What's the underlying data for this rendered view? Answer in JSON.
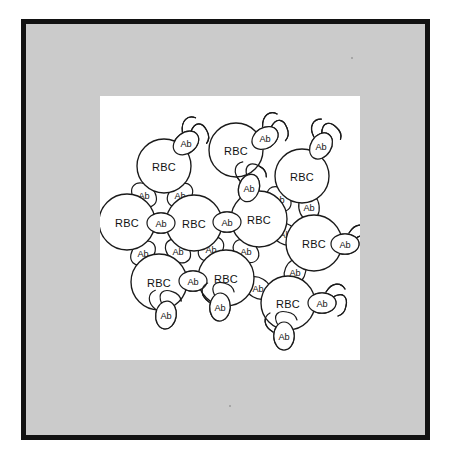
{
  "figure": {
    "canvas_background": "#ffffff",
    "mat_color": "#cbcbcb",
    "frame_color": "#121212",
    "ink_color": "#1a1a1a"
  },
  "legend": {
    "cell_label": "RBC",
    "antibody_label": "Ab"
  },
  "chart_data": {
    "type": "diagram",
    "cell_label": "RBC",
    "antibody_label": "Ab",
    "cell_count": 10,
    "antibody_count": 24,
    "cells": [
      {
        "id": "rbc-1",
        "label": "RBC",
        "cx": 64,
        "cy": 70,
        "r": 27
      },
      {
        "id": "rbc-2",
        "label": "RBC",
        "cx": 136,
        "cy": 54,
        "r": 27
      },
      {
        "id": "rbc-3",
        "label": "RBC",
        "cx": 202,
        "cy": 80,
        "r": 27
      },
      {
        "id": "rbc-4",
        "label": "RBC",
        "cx": 27,
        "cy": 126,
        "r": 28
      },
      {
        "id": "rbc-5",
        "label": "RBC",
        "cx": 94,
        "cy": 127,
        "r": 28
      },
      {
        "id": "rbc-6",
        "label": "RBC",
        "cx": 159,
        "cy": 123,
        "r": 28
      },
      {
        "id": "rbc-7",
        "label": "RBC",
        "cx": 214,
        "cy": 147,
        "r": 28
      },
      {
        "id": "rbc-8",
        "label": "RBC",
        "cx": 59,
        "cy": 186,
        "r": 28
      },
      {
        "id": "rbc-9",
        "label": "RBC",
        "cx": 126,
        "cy": 182,
        "r": 28
      },
      {
        "id": "rbc-10",
        "label": "RBC",
        "cx": 188,
        "cy": 207,
        "r": 27
      }
    ],
    "antibodies": [
      {
        "id": "ab-1",
        "label": "Ab",
        "cx": 86,
        "cy": 47,
        "rot": -38,
        "arms": "both"
      },
      {
        "id": "ab-2",
        "label": "Ab",
        "cx": 165,
        "cy": 42,
        "rot": -32,
        "arms": "both"
      },
      {
        "id": "ab-3",
        "label": "Ab",
        "cx": 221,
        "cy": 50,
        "rot": -58,
        "arms": "both"
      },
      {
        "id": "ab-4",
        "label": "Ab",
        "cx": 44,
        "cy": 99,
        "rot": 42,
        "arms": "none"
      },
      {
        "id": "ab-5",
        "label": "Ab",
        "cx": 80,
        "cy": 99,
        "rot": -38,
        "arms": "none"
      },
      {
        "id": "ab-6",
        "label": "Ab",
        "cx": 149,
        "cy": 92,
        "rot": -72,
        "arms": "both"
      },
      {
        "id": "ab-7",
        "label": "Ab",
        "cx": 179,
        "cy": 103,
        "rot": 48,
        "arms": "none"
      },
      {
        "id": "ab-8",
        "label": "Ab",
        "cx": 209,
        "cy": 111,
        "rot": 82,
        "arms": "none"
      },
      {
        "id": "ab-9",
        "label": "Ab",
        "cx": 61,
        "cy": 127,
        "rot": 0,
        "arms": "none"
      },
      {
        "id": "ab-10",
        "label": "Ab",
        "cx": 127,
        "cy": 126,
        "rot": 0,
        "arms": "none"
      },
      {
        "id": "ab-11",
        "label": "Ab",
        "cx": 185,
        "cy": 138,
        "rot": 30,
        "arms": "none"
      },
      {
        "id": "ab-12",
        "label": "Ab",
        "cx": 245,
        "cy": 148,
        "rot": 0,
        "arms": "both"
      },
      {
        "id": "ab-13",
        "label": "Ab",
        "cx": 43,
        "cy": 157,
        "rot": -44,
        "arms": "none"
      },
      {
        "id": "ab-14",
        "label": "Ab",
        "cx": 78,
        "cy": 155,
        "rot": 40,
        "arms": "none"
      },
      {
        "id": "ab-15",
        "label": "Ab",
        "cx": 111,
        "cy": 153,
        "rot": -38,
        "arms": "none"
      },
      {
        "id": "ab-16",
        "label": "Ab",
        "cx": 146,
        "cy": 155,
        "rot": 36,
        "arms": "none"
      },
      {
        "id": "ab-17",
        "label": "Ab",
        "cx": 195,
        "cy": 176,
        "rot": -66,
        "arms": "none"
      },
      {
        "id": "ab-18",
        "label": "Ab",
        "cx": 93,
        "cy": 185,
        "rot": 0,
        "arms": "none"
      },
      {
        "id": "ab-19",
        "label": "Ab",
        "cx": 158,
        "cy": 192,
        "rot": 30,
        "arms": "none"
      },
      {
        "id": "ab-20",
        "label": "Ab",
        "cx": 66,
        "cy": 219,
        "rot": -82,
        "arms": "both"
      },
      {
        "id": "ab-21",
        "label": "Ab",
        "cx": 120,
        "cy": 211,
        "rot": -86,
        "arms": "both"
      },
      {
        "id": "ab-22",
        "label": "Ab",
        "cx": 222,
        "cy": 207,
        "rot": 0,
        "arms": "both"
      },
      {
        "id": "ab-23",
        "label": "Ab",
        "cx": 184,
        "cy": 240,
        "rot": -90,
        "arms": "both"
      }
    ]
  }
}
